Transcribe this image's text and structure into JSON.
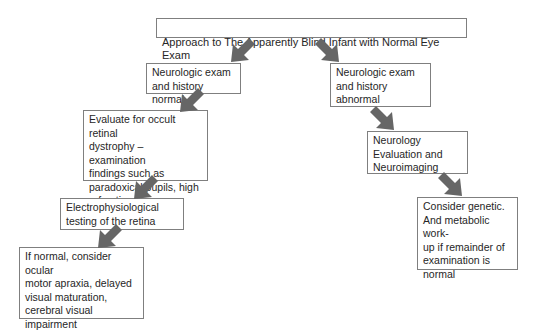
{
  "diagram": {
    "title": "Approach to The Apparently Blind Infant with Normal Eye Exam",
    "nodes": {
      "neuro_normal": "Neurologic exam\nand history normal",
      "neuro_abnormal": "Neurologic exam\nand history\nabnormal",
      "evaluate_retinal": "Evaluate for occult retinal\ndystrophy – examination\nfindings such as\nparadoxical pupils, high\nrefractive error",
      "electrophysiological": "Electrophysiological\ntesting of the retina",
      "if_normal": "If normal, consider ocular\nmotor apraxia, delayed\nvisual maturation,\ncerebral visual\nimpairment",
      "neurology_eval": "Neurology\nEvaluation and\nNeuroimaging",
      "consider_genetic": "Consider genetic.\nAnd metabolic work-\nup if remainder of\nexamination is\nnormal"
    },
    "edges": [
      {
        "from": "title",
        "to": "neuro_normal",
        "direction": "down-left"
      },
      {
        "from": "title",
        "to": "neuro_abnormal",
        "direction": "down-right"
      },
      {
        "from": "neuro_normal",
        "to": "evaluate_retinal",
        "direction": "down-left"
      },
      {
        "from": "evaluate_retinal",
        "to": "electrophysiological",
        "direction": "down-left"
      },
      {
        "from": "electrophysiological",
        "to": "if_normal",
        "direction": "down-left"
      },
      {
        "from": "neuro_abnormal",
        "to": "neurology_eval",
        "direction": "down-right"
      },
      {
        "from": "neurology_eval",
        "to": "consider_genetic",
        "direction": "down-right"
      }
    ],
    "colors": {
      "arrow": "#666666",
      "border": "#7f7f7f",
      "text": "#262626"
    }
  }
}
